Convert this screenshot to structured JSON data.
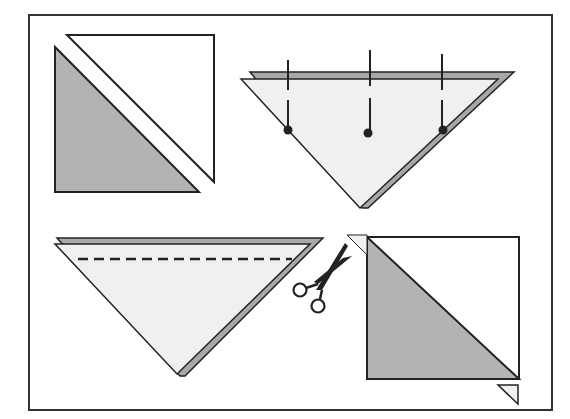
{
  "diagram": {
    "colors": {
      "frame": "#333333",
      "stroke": "#222222",
      "dark_fabric": "#b3b3b3",
      "light_fabric": "#f0f0f0",
      "fabric_edge": "#a8a8a8",
      "white": "#ffffff",
      "pin": "#222222",
      "scissors": "#222222"
    },
    "steps": [
      {
        "id": "step-1",
        "description": "Two fabric triangles: one dark, one white, placed diagonally apart"
      },
      {
        "id": "step-2",
        "description": "Triangles stacked right sides together, pinned with three pins"
      },
      {
        "id": "step-3",
        "description": "Stitch along long edge with dashed seam line; scissors indicate trimming"
      },
      {
        "id": "step-4",
        "description": "Opened half-square: dark triangle and white triangle forming a square, dog-ear tips trimmed"
      }
    ],
    "pins_count": 3
  }
}
